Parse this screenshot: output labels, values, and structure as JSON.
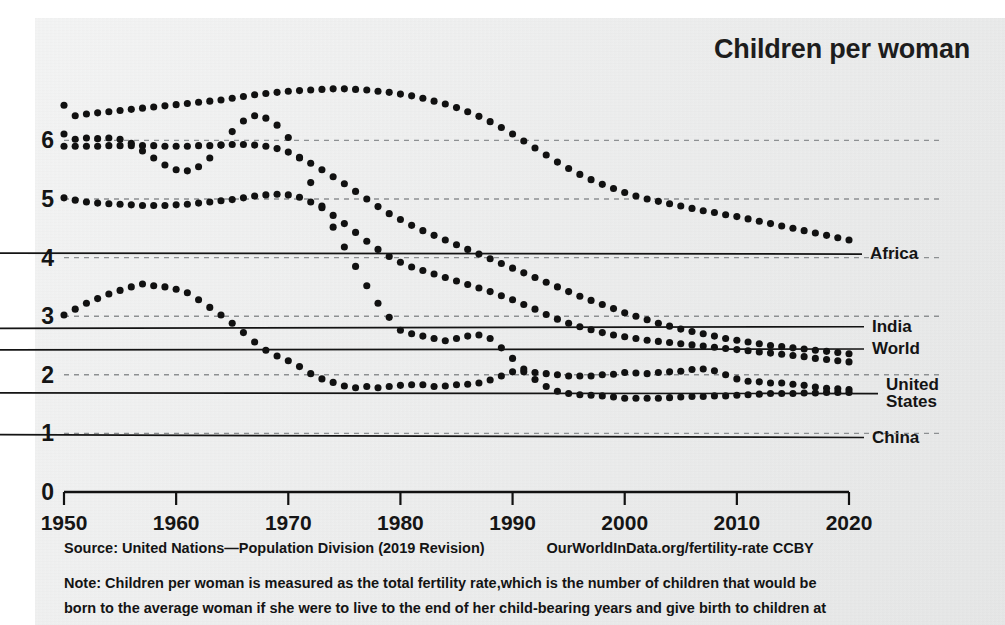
{
  "chart_data": {
    "type": "line",
    "title": "Children per woman",
    "xlabel": "",
    "ylabel": "",
    "xlim": [
      1950,
      2020
    ],
    "ylim": [
      0,
      6.6
    ],
    "grid": true,
    "legend_position": "right-inline-labels",
    "marker_style": "dotted",
    "xticks": [
      1950,
      1960,
      1970,
      1980,
      1990,
      2000,
      2010,
      2020
    ],
    "yticks": [
      0,
      1,
      2,
      3,
      4,
      5,
      6
    ],
    "x": [
      1950,
      1951,
      1952,
      1953,
      1954,
      1955,
      1956,
      1957,
      1958,
      1959,
      1960,
      1961,
      1962,
      1963,
      1964,
      1965,
      1966,
      1967,
      1968,
      1969,
      1970,
      1971,
      1972,
      1973,
      1974,
      1975,
      1976,
      1977,
      1978,
      1979,
      1980,
      1981,
      1982,
      1983,
      1984,
      1985,
      1986,
      1987,
      1988,
      1989,
      1990,
      1991,
      1992,
      1993,
      1994,
      1995,
      1996,
      1997,
      1998,
      1999,
      2000,
      2001,
      2002,
      2003,
      2004,
      2005,
      2006,
      2007,
      2008,
      2009,
      2010,
      2011,
      2012,
      2013,
      2014,
      2015,
      2016,
      2017,
      2018,
      2019,
      2020
    ],
    "series": [
      {
        "name": "Africa",
        "color": "#111111",
        "label_value": 4.3,
        "values": [
          6.6,
          6.42,
          6.45,
          6.47,
          6.49,
          6.51,
          6.53,
          6.55,
          6.57,
          6.59,
          6.61,
          6.63,
          6.65,
          6.67,
          6.69,
          6.72,
          6.75,
          6.78,
          6.8,
          6.82,
          6.84,
          6.85,
          6.86,
          6.87,
          6.88,
          6.88,
          6.87,
          6.86,
          6.84,
          6.82,
          6.79,
          6.76,
          6.72,
          6.67,
          6.62,
          6.56,
          6.49,
          6.41,
          6.32,
          6.22,
          6.11,
          5.99,
          5.87,
          5.75,
          5.63,
          5.52,
          5.42,
          5.33,
          5.25,
          5.18,
          5.11,
          5.05,
          5.0,
          4.96,
          4.92,
          4.88,
          4.84,
          4.8,
          4.77,
          4.73,
          4.7,
          4.66,
          4.62,
          4.58,
          4.54,
          4.5,
          4.46,
          4.42,
          4.38,
          4.34,
          4.3
        ]
      },
      {
        "name": "India",
        "color": "#111111",
        "label_value": 2.55,
        "values": [
          5.9,
          5.9,
          5.9,
          5.9,
          5.91,
          5.91,
          5.91,
          5.91,
          5.91,
          5.9,
          5.9,
          5.9,
          5.91,
          5.91,
          5.92,
          5.93,
          5.93,
          5.92,
          5.9,
          5.86,
          5.8,
          5.71,
          5.61,
          5.5,
          5.38,
          5.26,
          5.13,
          5.0,
          4.87,
          4.75,
          4.65,
          4.55,
          4.46,
          4.38,
          4.3,
          4.22,
          4.14,
          4.06,
          3.98,
          3.9,
          3.82,
          3.74,
          3.66,
          3.58,
          3.5,
          3.42,
          3.34,
          3.27,
          3.2,
          3.13,
          3.06,
          3.0,
          2.94,
          2.88,
          2.83,
          2.78,
          2.74,
          2.7,
          2.66,
          2.62,
          2.59,
          2.56,
          2.53,
          2.5,
          2.48,
          2.46,
          2.44,
          2.42,
          2.4,
          2.38,
          2.36
        ]
      },
      {
        "name": "World",
        "color": "#111111",
        "label_value": 2.2,
        "values": [
          5.02,
          4.98,
          4.95,
          4.93,
          4.92,
          4.91,
          4.9,
          4.89,
          4.89,
          4.89,
          4.9,
          4.91,
          4.93,
          4.95,
          4.97,
          4.99,
          5.02,
          5.05,
          5.07,
          5.08,
          5.07,
          5.03,
          4.95,
          4.85,
          4.72,
          4.58,
          4.43,
          4.28,
          4.14,
          4.02,
          3.92,
          3.84,
          3.78,
          3.72,
          3.66,
          3.6,
          3.54,
          3.48,
          3.42,
          3.35,
          3.28,
          3.2,
          3.12,
          3.03,
          2.95,
          2.88,
          2.82,
          2.77,
          2.72,
          2.68,
          2.65,
          2.62,
          2.59,
          2.57,
          2.55,
          2.53,
          2.51,
          2.49,
          2.47,
          2.45,
          2.43,
          2.41,
          2.39,
          2.37,
          2.35,
          2.33,
          2.31,
          2.28,
          2.26,
          2.24,
          2.22
        ]
      },
      {
        "name": "United States",
        "color": "#111111",
        "label_value": 1.87,
        "values": [
          3.02,
          3.12,
          3.22,
          3.3,
          3.38,
          3.44,
          3.5,
          3.55,
          3.52,
          3.5,
          3.46,
          3.4,
          3.28,
          3.15,
          3.02,
          2.88,
          2.72,
          2.56,
          2.42,
          2.32,
          2.24,
          2.14,
          2.02,
          1.93,
          1.87,
          1.81,
          1.78,
          1.8,
          1.78,
          1.8,
          1.82,
          1.83,
          1.83,
          1.8,
          1.81,
          1.83,
          1.84,
          1.86,
          1.91,
          1.98,
          2.05,
          2.05,
          2.04,
          2.02,
          2.0,
          1.98,
          1.98,
          1.98,
          2.0,
          2.01,
          2.04,
          2.03,
          2.02,
          2.04,
          2.05,
          2.06,
          2.09,
          2.1,
          2.07,
          2.0,
          1.93,
          1.89,
          1.88,
          1.86,
          1.86,
          1.84,
          1.82,
          1.79,
          1.77,
          1.76,
          1.75
        ]
      },
      {
        "name": "China",
        "color": "#111111",
        "label_value": 1.2,
        "values": [
          6.11,
          6.02,
          6.04,
          6.03,
          6.04,
          6.02,
          5.95,
          5.82,
          5.7,
          5.58,
          5.5,
          5.48,
          5.55,
          5.7,
          5.92,
          6.15,
          6.33,
          6.42,
          6.38,
          6.26,
          6.05,
          5.7,
          5.28,
          4.88,
          4.52,
          4.18,
          3.85,
          3.52,
          3.22,
          2.98,
          2.76,
          2.7,
          2.66,
          2.62,
          2.58,
          2.62,
          2.66,
          2.68,
          2.62,
          2.46,
          2.28,
          2.1,
          1.92,
          1.8,
          1.72,
          1.68,
          1.66,
          1.65,
          1.64,
          1.62,
          1.6,
          1.6,
          1.6,
          1.6,
          1.61,
          1.62,
          1.63,
          1.63,
          1.64,
          1.64,
          1.65,
          1.66,
          1.67,
          1.68,
          1.68,
          1.68,
          1.69,
          1.69,
          1.7,
          1.7,
          1.7
        ]
      }
    ],
    "series_labels": [
      {
        "name": "Africa",
        "lines": [
          "Africa"
        ],
        "y": 4.06,
        "x_px": 870,
        "anchor_x": 849,
        "anchor_y": 4.32
      },
      {
        "name": "India",
        "lines": [
          "India"
        ],
        "y": 2.82,
        "x_px": 872,
        "anchor_x": 849,
        "anchor_y": 2.42
      },
      {
        "name": "World",
        "lines": [
          "World"
        ],
        "y": 2.44,
        "x_px": 872,
        "anchor_x": 849,
        "anchor_y": 2.22
      },
      {
        "name": "United States",
        "lines": [
          "United",
          "States"
        ],
        "y": 1.68,
        "x_px": 886,
        "anchor_x": 849,
        "anchor_y": 1.83
      },
      {
        "name": "China",
        "lines": [
          "China"
        ],
        "y": 0.93,
        "x_px": 872,
        "anchor_x": 838,
        "anchor_y": 1.66
      }
    ]
  },
  "footer": {
    "source": "Source: United Nations—Population Division (2019 Revision)",
    "attribution": "OurWorldInData.org/fertility-rate CCBY",
    "note_lines": [
      "Note: Children per woman is measured as the total fertility rate,which is the number of children that would be",
      "born to the average woman if she were to live to the end of her child-bearing years and give birth to children at"
    ]
  }
}
